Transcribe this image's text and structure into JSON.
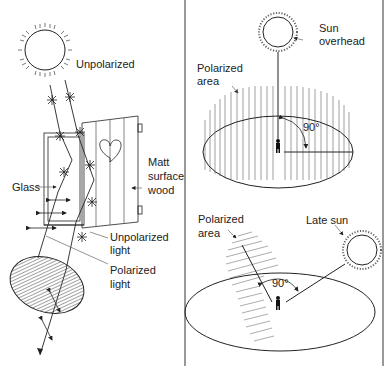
{
  "panels": {
    "left": {
      "labels": {
        "unpolarized": "Unpolarized",
        "matt_line1": "Matt",
        "matt_line2": "surface",
        "matt_line3": "wood",
        "glass": "Glass",
        "unpolarized_light_line1": "Unpolarized",
        "unpolarized_light_line2": "light",
        "polarized_light_line1": "Polarized",
        "polarized_light_line2": "light"
      }
    },
    "top_right": {
      "labels": {
        "sun_line1": "Sun",
        "sun_line2": "overhead",
        "polarized_line1": "Polarized",
        "polarized_line2": "area",
        "angle": "90°"
      }
    },
    "bottom_right": {
      "labels": {
        "polarized_line1": "Polarized",
        "polarized_line2": "area",
        "late_sun": "Late sun",
        "angle": "90°"
      }
    }
  },
  "colors": {
    "line": "#222222",
    "divider": "#777777",
    "hatch": "#555555",
    "background": "#ffffff"
  }
}
